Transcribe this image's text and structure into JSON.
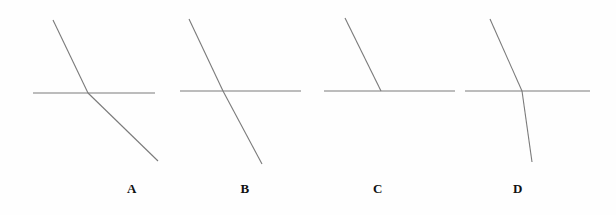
{
  "figure": {
    "width": 616,
    "height": 215,
    "background_color": "#fefefe",
    "stroke_color": "#7a7a7a",
    "arrow_color": "#111111",
    "label_color": "#111111"
  },
  "panels": [
    {
      "id": "panel-a",
      "label": "A",
      "label_x": 132,
      "label_y": 192,
      "boundary": {
        "x1": 33,
        "y1": 93,
        "x2": 155,
        "y2": 93
      },
      "incident_ray": {
        "x1": 53,
        "y1": 20,
        "x2": 88,
        "y2": 93
      },
      "outgoing_ray": {
        "x1": 88,
        "y1": 93,
        "x2": 158,
        "y2": 161
      },
      "arrow_tip": {
        "x": 160,
        "y": 163
      },
      "behavior": "ray bends away from the normal after crossing the boundary"
    },
    {
      "id": "panel-b",
      "label": "B",
      "label_x": 245,
      "label_y": 192,
      "boundary": {
        "x1": 180,
        "y1": 91,
        "x2": 301,
        "y2": 91
      },
      "incident_ray": {
        "x1": 189,
        "y1": 19,
        "x2": 223,
        "y2": 91
      },
      "outgoing_ray": {
        "x1": 223,
        "y1": 91,
        "x2": 262,
        "y2": 164
      },
      "arrow_tip": {
        "x": 264,
        "y": 166
      },
      "behavior": "ray continues straight through the boundary without bending"
    },
    {
      "id": "panel-c",
      "label": "C",
      "label_x": 378,
      "label_y": 192,
      "boundary": {
        "x1": 324,
        "y1": 91,
        "x2": 455,
        "y2": 91
      },
      "incident_ray": {
        "x1": 345,
        "y1": 18,
        "x2": 381,
        "y2": 91
      },
      "outgoing_ray": {
        "x1": 381,
        "y1": 91,
        "x2": 455,
        "y2": 91
      },
      "arrow_tip": {
        "x": 458,
        "y": 91
      },
      "behavior": "ray bends to travel along the boundary surface"
    },
    {
      "id": "panel-d",
      "label": "D",
      "label_x": 518,
      "label_y": 192,
      "boundary": {
        "x1": 465,
        "y1": 91,
        "x2": 590,
        "y2": 91
      },
      "incident_ray": {
        "x1": 490,
        "y1": 19,
        "x2": 522,
        "y2": 91
      },
      "outgoing_ray": {
        "x1": 522,
        "y1": 91,
        "x2": 532,
        "y2": 162
      },
      "arrow_tip": {
        "x": 533,
        "y": 165
      },
      "behavior": "ray bends toward the normal after crossing the boundary"
    }
  ]
}
